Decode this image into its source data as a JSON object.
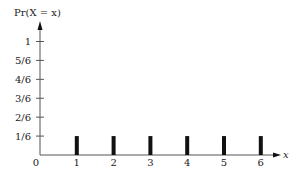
{
  "chart_data": {
    "type": "bar",
    "title": "",
    "ylabel": "Pr(X = x)",
    "xlabel": "x",
    "categories": [
      "1",
      "2",
      "3",
      "4",
      "5",
      "6"
    ],
    "x": [
      1,
      2,
      3,
      4,
      5,
      6
    ],
    "values": [
      0.1667,
      0.1667,
      0.1667,
      0.1667,
      0.1667,
      0.1667
    ],
    "value_labels": [
      "1/6",
      "1/6",
      "1/6",
      "1/6",
      "1/6",
      "1/6"
    ],
    "origin_label": "0",
    "yticks": [
      {
        "value": 0.1667,
        "label": "1/6"
      },
      {
        "value": 0.3333,
        "label": "2/6"
      },
      {
        "value": 0.5,
        "label": "3/6"
      },
      {
        "value": 0.6667,
        "label": "4/6"
      },
      {
        "value": 0.8333,
        "label": "5/6"
      },
      {
        "value": 1.0,
        "label": "1"
      }
    ],
    "ylim": [
      0,
      1
    ],
    "xlim": [
      0,
      6
    ],
    "grid": false,
    "legend": null,
    "bar_color": "#111111",
    "axis_color": "#555555"
  }
}
